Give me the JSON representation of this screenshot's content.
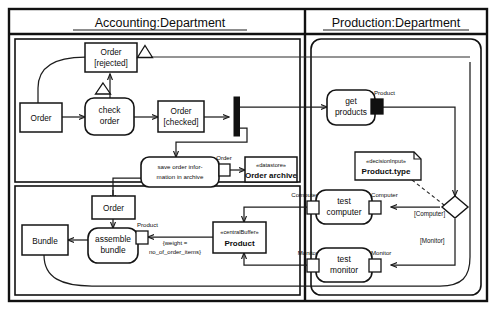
{
  "diagram": {
    "type": "uml-activity-diagram",
    "partitions": [
      {
        "id": "accounting",
        "label": "Accounting:Department"
      },
      {
        "id": "production",
        "label": "Production:Department"
      }
    ],
    "nodes": {
      "order_in": {
        "label": "Order",
        "kind": "object-node"
      },
      "order_rejected": {
        "label": "Order",
        "state": "[rejected]",
        "kind": "object-node"
      },
      "check_order": {
        "label_line1": "check",
        "label_line2": "order",
        "kind": "action"
      },
      "order_checked": {
        "label": "Order",
        "state": "[checked]",
        "kind": "object-node"
      },
      "fork": {
        "kind": "fork-bar"
      },
      "save_order": {
        "label_line1": "save order infor-",
        "label_line2": "mation in archive",
        "kind": "action"
      },
      "order_archive": {
        "stereotype": "«datastore»",
        "label": "Order archive",
        "kind": "datastore"
      },
      "get_products": {
        "label_line1": "get",
        "label_line2": "products",
        "kind": "action"
      },
      "decision_input_note": {
        "stereotype": "«decisionInput»",
        "label": "Product.type",
        "kind": "note"
      },
      "decision": {
        "kind": "decision-diamond"
      },
      "test_computer": {
        "label_line1": "test",
        "label_line2": "computer",
        "kind": "action"
      },
      "test_monitor": {
        "label_line1": "test",
        "label_line2": "monitor",
        "kind": "action"
      },
      "product_buffer": {
        "stereotype": "«centralBuffer»",
        "label": "Product",
        "kind": "central-buffer"
      },
      "order_mid": {
        "label": "Order",
        "kind": "object-node"
      },
      "assemble_bundle": {
        "label_line1": "assemble",
        "label_line2": "bundle",
        "kind": "action"
      },
      "bundle": {
        "label": "Bundle",
        "kind": "object-node"
      }
    },
    "pins": {
      "save_order_out": "Order",
      "get_products_out": "Product",
      "test_computer_in": "Computer",
      "test_computer_out": "Computer",
      "test_monitor_in": "Monitor",
      "test_monitor_out": "Monitor",
      "assemble_bundle_in": "Product"
    },
    "guards": {
      "computer": "[Computer]",
      "monitor": "[Monitor]"
    },
    "constraint": {
      "line1": "{weight =",
      "line2": "no_of_order_items}"
    }
  },
  "colors": {
    "stroke": "#141414",
    "background": "#ffffff",
    "fill_pin": "#101010"
  }
}
